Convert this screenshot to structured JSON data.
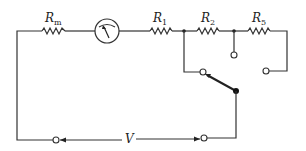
{
  "diagram": {
    "type": "circuit-schematic",
    "title": "",
    "components": [
      {
        "id": "Rm",
        "kind": "resistor",
        "label": "R",
        "subscript": "m"
      },
      {
        "id": "meter",
        "kind": "galvanometer",
        "label": ""
      },
      {
        "id": "R1",
        "kind": "resistor",
        "label": "R",
        "subscript": "1"
      },
      {
        "id": "R2",
        "kind": "resistor",
        "label": "R",
        "subscript": "2"
      },
      {
        "id": "R5",
        "kind": "resistor",
        "label": "R",
        "subscript": "5"
      },
      {
        "id": "switch",
        "kind": "selector-switch",
        "label": ""
      },
      {
        "id": "V",
        "kind": "voltage-terminals",
        "label": "V"
      }
    ],
    "labels": {
      "rm": {
        "main": "R",
        "sub": "m"
      },
      "r1": {
        "main": "R",
        "sub": "1"
      },
      "r2": {
        "main": "R",
        "sub": "2"
      },
      "r5": {
        "main": "R",
        "sub": "5"
      },
      "v": "V"
    },
    "colors": {
      "line": "#333333",
      "background": "#ffffff"
    }
  }
}
